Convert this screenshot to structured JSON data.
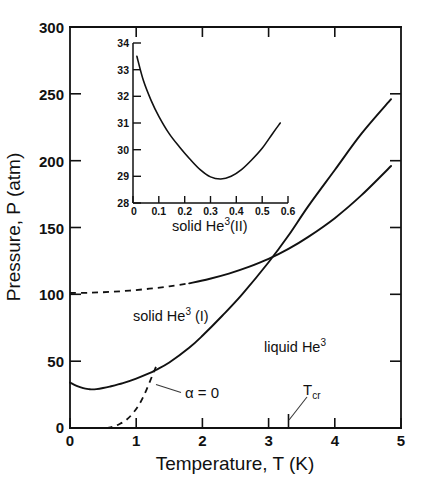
{
  "figure": {
    "background_color": "#ffffff",
    "line_color": "#111111"
  },
  "chart_data": {
    "type": "line",
    "title": "",
    "xlabel": "Temperature, T (K)",
    "ylabel": "Pressure, P (atm)",
    "xlim": [
      0,
      5
    ],
    "ylim": [
      0,
      300
    ],
    "grid": false,
    "legend": "none",
    "x_ticks": [
      0,
      1,
      2,
      3,
      4,
      5
    ],
    "x_tick_labels": [
      "0",
      "1",
      "2",
      "3",
      "4",
      "5"
    ],
    "y_ticks": [
      0,
      50,
      100,
      150,
      200,
      250,
      300
    ],
    "y_tick_labels": [
      "0",
      "50",
      "100",
      "150",
      "200",
      "250",
      "300"
    ],
    "series": [
      {
        "name": "melting curve (solid He3(I) / liquid He3)",
        "style": "solid",
        "x": [
          0.0,
          0.1,
          0.2,
          0.3,
          0.32,
          0.4,
          0.5,
          0.6,
          0.8,
          1.0,
          1.2,
          1.3,
          1.5,
          1.8,
          2.0,
          2.3,
          2.6,
          3.0,
          3.3,
          3.6,
          4.0,
          4.4,
          4.85
        ],
        "y": [
          34.0,
          31.5,
          29.8,
          29.0,
          28.9,
          29.1,
          29.9,
          31.0,
          33.6,
          37.0,
          41.0,
          43.5,
          49.0,
          60.0,
          69.0,
          84.0,
          100.0,
          124.0,
          144.0,
          166.0,
          193.0,
          220.0,
          246.0
        ]
      },
      {
        "name": "solid He3(I)-He3(II) boundary, extrapolated",
        "style": "dashed",
        "x": [
          0.0,
          0.3,
          0.6,
          0.9,
          1.2,
          1.5,
          1.8
        ],
        "y": [
          101.0,
          101.2,
          101.8,
          102.8,
          104.2,
          106.0,
          108.2
        ]
      },
      {
        "name": "solid He3(I)-He3(II) boundary, measured",
        "style": "solid",
        "x": [
          1.8,
          2.1,
          2.4,
          2.7,
          3.0,
          3.3,
          3.6,
          4.0,
          4.4,
          4.85
        ],
        "y": [
          108.2,
          111.5,
          115.5,
          120.5,
          126.5,
          134.0,
          143.0,
          157.0,
          174.0,
          196.0
        ]
      },
      {
        "name": "alpha = 0 locus",
        "style": "dashed",
        "x": [
          0.55,
          0.65,
          0.75,
          0.85,
          0.95,
          1.05,
          1.15,
          1.25,
          1.3
        ],
        "y": [
          0.0,
          1.0,
          3.0,
          6.0,
          11.0,
          18.0,
          28.0,
          40.0,
          46.0
        ]
      }
    ],
    "annotations": [
      {
        "text": "solid He3(II)",
        "x": 1.55,
        "y": 152
      },
      {
        "text": "solid He3 (I)",
        "x": 0.95,
        "y": 85
      },
      {
        "text": "liquid He3",
        "x": 3.1,
        "y": 62
      },
      {
        "text": "alpha = 0",
        "x": 1.75,
        "y": 24
      },
      {
        "text": "Tcr",
        "x": 3.3,
        "y": 0
      }
    ],
    "inset": {
      "type": "line",
      "title": "",
      "xlabel": "",
      "ylabel": "",
      "xlim": [
        0,
        0.6
      ],
      "ylim": [
        28,
        34
      ],
      "grid": false,
      "x_ticks": [
        0,
        0.1,
        0.2,
        0.3,
        0.4,
        0.5,
        0.6
      ],
      "x_tick_labels": [
        "0",
        "0.1",
        "0.2",
        "0.3",
        "0.4",
        "0.5",
        "0.6"
      ],
      "y_ticks": [
        28,
        29,
        30,
        31,
        32,
        33,
        34
      ],
      "y_tick_labels": [
        "28",
        "29",
        "30",
        "31",
        "32",
        "33",
        "34"
      ],
      "series": [
        {
          "name": "melting curve minimum detail",
          "style": "solid",
          "x": [
            0.015,
            0.04,
            0.07,
            0.1,
            0.14,
            0.18,
            0.22,
            0.26,
            0.3,
            0.34,
            0.38,
            0.42,
            0.46,
            0.5,
            0.54,
            0.57
          ],
          "y": [
            33.5,
            32.6,
            31.85,
            31.25,
            30.6,
            30.1,
            29.65,
            29.25,
            28.98,
            28.9,
            29.0,
            29.25,
            29.62,
            30.05,
            30.6,
            31.0
          ]
        }
      ]
    }
  },
  "axes": {
    "y_title": "Pressure, P (atm)",
    "x_title": "Temperature, T (K)",
    "y_labels": [
      "300",
      "250",
      "200",
      "150",
      "100",
      "50",
      "0"
    ],
    "x_labels": [
      "0",
      "1",
      "2",
      "3",
      "4",
      "5"
    ]
  },
  "inset_axes": {
    "y_labels": [
      "34",
      "33",
      "32",
      "31",
      "30",
      "29",
      "28"
    ],
    "x_labels": [
      "0",
      "0.1",
      "0.2",
      "0.3",
      "0.4",
      "0.5",
      "0.6"
    ]
  },
  "labels": {
    "solid_two_prefix": "solid He",
    "solid_two_sup": "3",
    "solid_two_suffix": "(II)",
    "solid_one_prefix": "solid He",
    "solid_one_sup": "3",
    "solid_one_suffix": " (I)",
    "liquid_prefix": "liquid He",
    "liquid_sup": "3",
    "alpha_zero": "α = 0",
    "tcr_main": "T",
    "tcr_sub": "cr"
  }
}
